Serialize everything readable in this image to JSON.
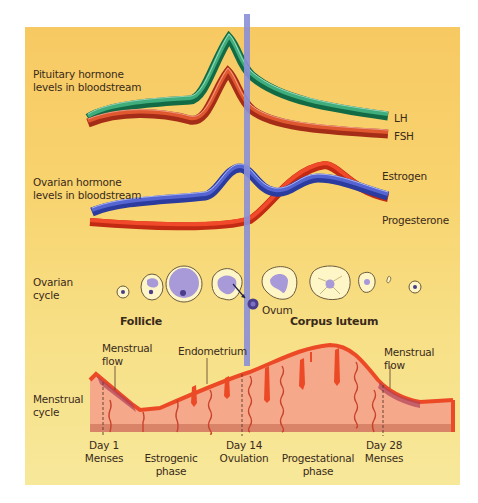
{
  "diagram": {
    "colors": {
      "background_top": "#f7c963",
      "background_bottom": "#f7e89a",
      "lh": "#1f8a5e",
      "fsh": "#d9482b",
      "estrogen": "#4a5bc4",
      "progesterone": "#ec3b22",
      "ovulation_bar": "#8a8fd6",
      "endometrium": "#f5a88a",
      "endometrium_edge": "#ec4a26"
    },
    "sections": {
      "pituitary": {
        "label_line1": "Pituitary hormone",
        "label_line2": "levels in bloodstream"
      },
      "ovarian_hormone": {
        "label_line1": "Ovarian hormone",
        "label_line2": "levels in bloodstream"
      },
      "ovarian_cycle": {
        "label_line1": "Ovarian",
        "label_line2": "cycle"
      },
      "menstrual_cycle": {
        "label_line1": "Menstrual",
        "label_line2": "cycle"
      }
    },
    "legend": {
      "lh": "LH",
      "fsh": "FSH",
      "estrogen": "Estrogen",
      "progesterone": "Progesterone"
    },
    "annotations": {
      "follicle": "Follicle",
      "ovum": "Ovum",
      "corpus_luteum": "Corpus luteum",
      "menstrual_flow_left_1": "Menstrual",
      "menstrual_flow_left_2": "flow",
      "endometrium": "Endometrium",
      "menstrual_flow_right_1": "Menstrual",
      "menstrual_flow_right_2": "flow"
    },
    "timeline": [
      {
        "line1": "Day 1",
        "line2": "Menses"
      },
      {
        "line1": "",
        "line2": "Estrogenic",
        "line3": "phase"
      },
      {
        "line1": "Day 14",
        "line2": "Ovulation"
      },
      {
        "line1": "",
        "line2": "Progestational",
        "line3": "phase"
      },
      {
        "line1": "Day 28",
        "line2": "Menses"
      }
    ]
  }
}
